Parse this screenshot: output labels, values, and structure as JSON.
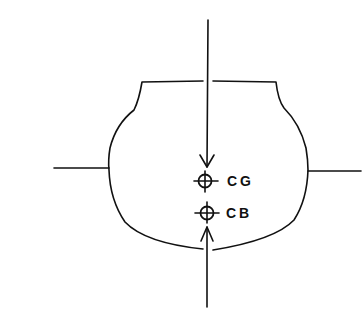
{
  "diagram": {
    "type": "hull-cross-section",
    "labels": {
      "cg": "CG",
      "cb": "CB"
    },
    "colors": {
      "stroke": "#111111",
      "background": "#ffffff"
    },
    "elements": [
      {
        "id": "hull-outline",
        "kind": "shape"
      },
      {
        "id": "waterline-left",
        "kind": "line"
      },
      {
        "id": "waterline-right",
        "kind": "line"
      },
      {
        "id": "gravity-arrow",
        "kind": "arrow",
        "direction": "down"
      },
      {
        "id": "buoyancy-arrow",
        "kind": "arrow",
        "direction": "up"
      },
      {
        "id": "cg-marker",
        "kind": "crosshair-circle"
      },
      {
        "id": "cb-marker",
        "kind": "crosshair-circle"
      }
    ]
  }
}
